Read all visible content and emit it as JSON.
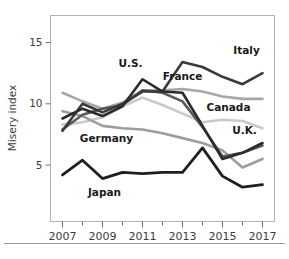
{
  "chart_data": {
    "type": "line",
    "title": "",
    "xlabel": "",
    "ylabel": "Misery index",
    "xlim": [
      2006.4,
      2017.6
    ],
    "ylim": [
      0.4,
      17.2
    ],
    "yticks": [
      5,
      10,
      15
    ],
    "ytick_labels": [
      "5",
      "10",
      "15"
    ],
    "xticks": [
      2007,
      2008,
      2009,
      2010,
      2011,
      2012,
      2013,
      2014,
      2015,
      2016,
      2017
    ],
    "xtick_labels": [
      "2007",
      "",
      "2009",
      "",
      "2011",
      "",
      "2013",
      "",
      "2015",
      "",
      "2017"
    ],
    "grid": false,
    "legend_position": "inline-labels",
    "x": [
      2007,
      2008,
      2009,
      2010,
      2011,
      2012,
      2013,
      2014,
      2015,
      2016,
      2017
    ],
    "series": [
      {
        "name": "Italy",
        "color": "#3a3a3a",
        "width": 2.6,
        "values": [
          7.8,
          10.0,
          9.3,
          10.0,
          11.0,
          11.0,
          13.4,
          13.0,
          12.2,
          11.6,
          12.5
        ],
        "label": "Italy",
        "label_x": 2016.2,
        "label_y": 14.1
      },
      {
        "name": "France",
        "color": "#a8a8a8",
        "width": 2.6,
        "values": [
          10.9,
          10.2,
          9.6,
          10.1,
          11.1,
          11.1,
          11.2,
          11.0,
          10.6,
          10.4,
          10.4
        ],
        "label": "France",
        "label_x": 2013.0,
        "label_y": 11.9
      },
      {
        "name": "Canada",
        "color": "#c9c9c9",
        "width": 2.6,
        "values": [
          8.3,
          8.5,
          8.9,
          9.8,
          10.5,
          9.9,
          9.2,
          8.5,
          8.7,
          8.6,
          8.0
        ],
        "label": "Canada",
        "label_x": 2015.3,
        "label_y": 9.4
      },
      {
        "name": "U.K.",
        "color": "#5a5a5a",
        "width": 2.6,
        "values": [
          7.9,
          9.1,
          9.6,
          9.9,
          11.1,
          10.9,
          10.2,
          8.1,
          5.7,
          6.0,
          6.6
        ],
        "label": "U.K.",
        "label_x": 2016.1,
        "label_y": 7.5
      },
      {
        "name": "U.S.",
        "color": "#2b2b2b",
        "width": 2.6,
        "values": [
          8.8,
          9.6,
          9.0,
          9.8,
          12.0,
          11.0,
          10.9,
          8.2,
          5.5,
          6.0,
          6.8
        ],
        "label": "U.S.",
        "label_x": 2010.4,
        "label_y": 13.0
      },
      {
        "name": "Germany",
        "color": "#9d9d9d",
        "width": 2.6,
        "values": [
          9.4,
          9.0,
          8.2,
          8.0,
          7.9,
          7.6,
          7.2,
          6.8,
          6.2,
          4.8,
          5.5
        ],
        "label": "Germany",
        "label_x": 2009.2,
        "label_y": 6.9
      },
      {
        "name": "Japan",
        "color": "#1f1f1f",
        "width": 2.8,
        "values": [
          4.2,
          5.4,
          3.9,
          4.4,
          4.3,
          4.4,
          4.4,
          6.4,
          4.1,
          3.2,
          3.4
        ],
        "label": "Japan",
        "label_x": 2009.1,
        "label_y": 2.5
      }
    ]
  }
}
